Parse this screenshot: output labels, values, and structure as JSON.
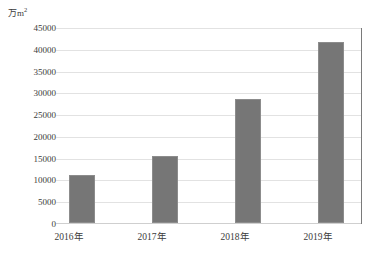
{
  "chart_data": {
    "type": "bar",
    "title": "",
    "subtitle": "",
    "unit_label": "万m",
    "unit_superscript": "2",
    "xlabel": "",
    "ylabel": "万m²",
    "categories": [
      "2016年",
      "2017年",
      "2018年",
      "2019年"
    ],
    "values": [
      11000,
      15500,
      28600,
      41700
    ],
    "series": [
      {
        "name": "面积",
        "values": [
          11000,
          15500,
          28600,
          41700
        ]
      }
    ],
    "ylim": [
      0,
      45000
    ],
    "y_tick_step": 5000,
    "y_ticks": [
      0,
      5000,
      10000,
      15000,
      20000,
      25000,
      30000,
      35000,
      40000,
      45000
    ],
    "y_tick_labels": [
      "0",
      "5000",
      "10000",
      "15000",
      "20000",
      "25000",
      "30000",
      "35000",
      "40000",
      "45000"
    ],
    "grid": true,
    "grid_orientation": "horizontal",
    "legend": false,
    "legend_position": "none",
    "bar_color": "#767676",
    "bar_border_color": "#8c8c8c",
    "gridline_color": "#e2e2e2",
    "axis_color": "#7a7a7a",
    "text_color": "#3b3b3b",
    "background_color": "#ffffff"
  }
}
